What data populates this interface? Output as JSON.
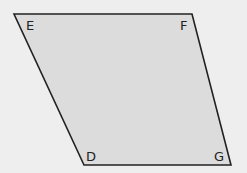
{
  "diagram": {
    "type": "parallelogram",
    "colors": {
      "background": "#eeeeee",
      "fill": "#dcdcdc",
      "stroke": "#222222"
    },
    "vertices": [
      {
        "name": "E",
        "x": 14,
        "y": 14
      },
      {
        "name": "F",
        "x": 192,
        "y": 14
      },
      {
        "name": "G",
        "x": 231,
        "y": 165
      },
      {
        "name": "D",
        "x": 84,
        "y": 165
      }
    ],
    "labels": {
      "E": "E",
      "F": "F",
      "G": "G",
      "D": "D"
    }
  }
}
